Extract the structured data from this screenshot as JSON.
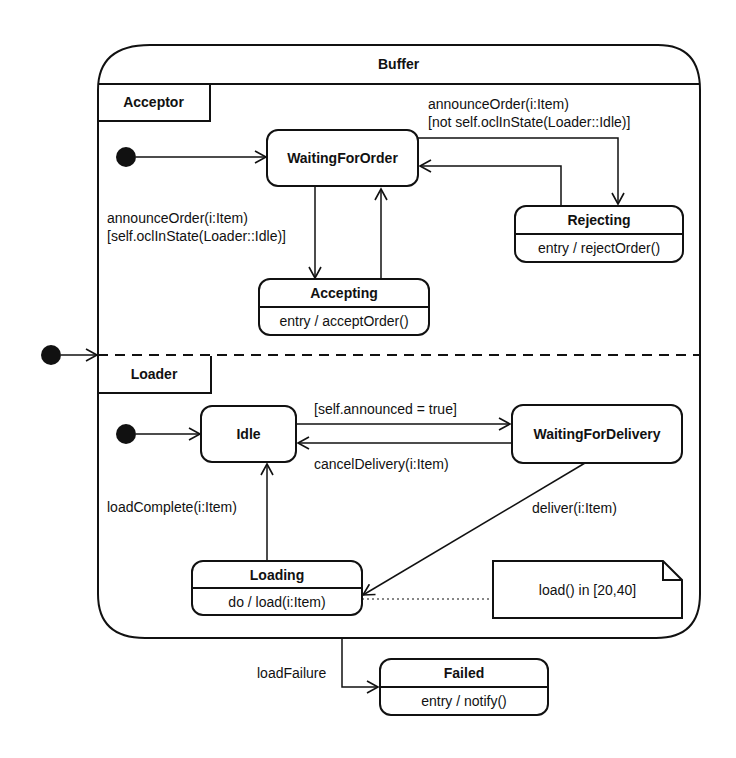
{
  "diagram": {
    "type": "UML state machine diagram",
    "composite_state": {
      "name": "Buffer"
    },
    "regions": [
      {
        "name": "Acceptor"
      },
      {
        "name": "Loader"
      }
    ],
    "states": {
      "waiting_for_order": {
        "name": "WaitingForOrder"
      },
      "rejecting": {
        "name": "Rejecting",
        "activity": "entry / rejectOrder()"
      },
      "accepting": {
        "name": "Accepting",
        "activity": "entry / acceptOrder()"
      },
      "idle": {
        "name": "Idle"
      },
      "waiting_for_delivery": {
        "name": "WaitingForDelivery"
      },
      "loading": {
        "name": "Loading",
        "activity": "do / load(i:Item)"
      },
      "failed": {
        "name": "Failed",
        "activity": "entry / notify()"
      }
    },
    "transitions": {
      "to_rejecting_line1": "announceOrder(i:Item)",
      "to_rejecting_line2": "[not self.oclInState(Loader::Idle)]",
      "to_accepting_line1": "announceOrder(i:Item)",
      "to_accepting_line2": "[self.oclInState(Loader::Idle)]",
      "idle_to_wfd": "[self.announced = true]",
      "wfd_to_idle": "cancelDelivery(i:Item)",
      "wfd_to_loading": "deliver(i:Item)",
      "loading_to_idle": "loadComplete(i:Item)",
      "buffer_to_failed": "loadFailure"
    },
    "note": {
      "text": "load() in [20,40]"
    }
  }
}
